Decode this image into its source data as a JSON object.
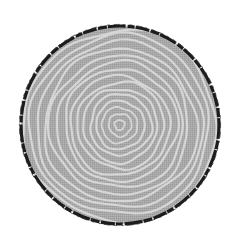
{
  "image": {
    "subject": "tree-ring-cross-section",
    "width": 240,
    "height": 241,
    "background": "#ffffff"
  },
  "stump": {
    "center": [
      120,
      125
    ],
    "radius": 100,
    "fill": "#a9a9a9",
    "ring_color": "#d6d6d6",
    "bark_color": "#1a1a1a",
    "bark_width": 3,
    "ring_count": 15
  }
}
